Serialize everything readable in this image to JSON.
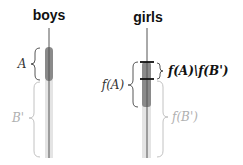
{
  "diagram": {
    "columns": [
      {
        "id": "boys",
        "label": "boys"
      },
      {
        "id": "girls",
        "label": "girls"
      }
    ],
    "labels": {
      "boys_A": "A",
      "boys_B": "B'",
      "girls_fA": "f(A)",
      "girls_diff": "f(A)\\f(B')",
      "girls_fB": "f(B')"
    },
    "colors": {
      "dark_bar": "#8a8a8a",
      "light_bar": "#e2e2e2",
      "line": "#555555",
      "tick": "#111111",
      "light_text": "#b0b0b0",
      "dark_text": "#222222"
    }
  }
}
